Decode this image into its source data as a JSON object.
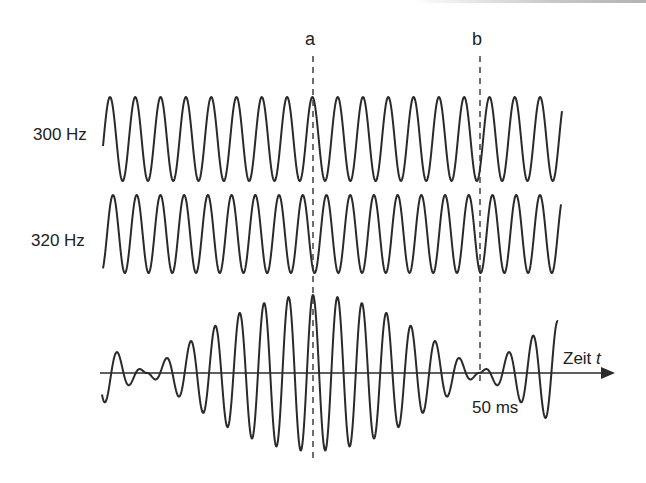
{
  "figure": {
    "markers": [
      {
        "id": "a",
        "label": "a",
        "x": 313,
        "y_top": 56,
        "y_bottom": 462
      },
      {
        "id": "b",
        "label": "b",
        "x": 480,
        "y_top": 56,
        "y_bottom": 385
      }
    ],
    "signals": [
      {
        "id": "tone-300",
        "label": "300 Hz",
        "freq_hz": 300,
        "x_start": 103,
        "x_end": 562,
        "mid_y": 139,
        "amp_px": 42,
        "period_px": 25.3,
        "phase_x": 110
      },
      {
        "id": "tone-320",
        "label": "320 Hz",
        "freq_hz": 320,
        "x_start": 103,
        "x_end": 561,
        "mid_y": 234,
        "amp_px": 39,
        "period_px": 23.72,
        "phase_x": 113
      }
    ],
    "beat": {
      "label": "Zeit",
      "label_var": "t",
      "duration_label": "50 ms",
      "x_start": 102,
      "x_end": 558,
      "axis_y": 373,
      "axis_x_start": 100,
      "axis_x_end": 615,
      "amp_px": 39,
      "envelope_max_x": 313,
      "envelope_min_x": 480,
      "carrier_period_px": 24.45
    }
  }
}
